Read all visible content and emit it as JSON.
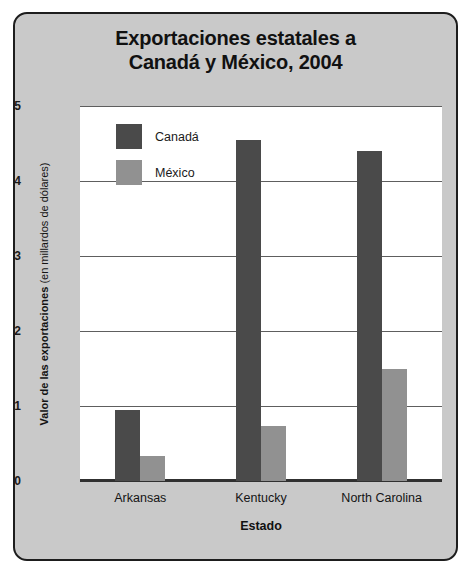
{
  "chart_data": {
    "type": "bar",
    "title": "Exportaciones estatales a Canadá y México, 2004",
    "title_lines": [
      "Exportaciones estatales a",
      "Canadá y México, 2004"
    ],
    "categories": [
      "Arkansas",
      "Kentucky",
      "North Carolina"
    ],
    "series": [
      {
        "name": "Canadá",
        "values": [
          0.95,
          4.55,
          4.4
        ],
        "color": "#4a4a4a"
      },
      {
        "name": "México",
        "values": [
          0.33,
          0.73,
          1.5
        ],
        "color": "#919191"
      }
    ],
    "xlabel": "Estado",
    "ylabel": "Valor de las exportaciones (en millardos de dólares)",
    "ylabel_bold_part": "Valor de las exportaciones",
    "ylabel_regular_part": "(en millardos de dólares)",
    "ylim": [
      0,
      5
    ],
    "yticks": [
      0,
      1,
      2,
      3,
      4,
      5
    ],
    "ytick_labels": [
      "0",
      "1",
      "2",
      "3",
      "4",
      "5"
    ],
    "grid": true,
    "legend_position": "top-left-inside"
  },
  "figure": {
    "panel_background": "#c9c9c9",
    "plot_background": "#ffffff",
    "border_color": "#1d1d1d",
    "gridline_color": "#5e5e5e",
    "axis_color": "#303030"
  }
}
